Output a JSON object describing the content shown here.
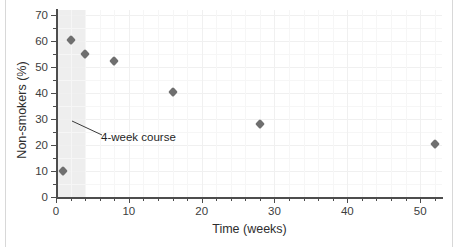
{
  "figure": {
    "background": "#ffffff",
    "frame_color": "#d8d8d8"
  },
  "chart_data": {
    "type": "scatter",
    "title": "",
    "xlabel": "Time (weeks)",
    "ylabel": "Non-smokers (%)",
    "xlim": [
      0,
      53
    ],
    "ylim": [
      0,
      72
    ],
    "xticks": [
      0,
      10,
      20,
      30,
      40,
      50
    ],
    "xtick_labels": [
      "0",
      "10",
      "20",
      "30",
      "40",
      "50"
    ],
    "xticks_minor": [
      2,
      4,
      6,
      8,
      12,
      14,
      16,
      18,
      22,
      24,
      26,
      28,
      32,
      34,
      36,
      38,
      42,
      44,
      46,
      48,
      52
    ],
    "yticks": [
      0,
      10,
      20,
      30,
      40,
      50,
      60,
      70
    ],
    "ytick_labels": [
      "0",
      "10",
      "20",
      "30",
      "40",
      "50",
      "60",
      "70"
    ],
    "yticks_minor": [
      5,
      15,
      25,
      35,
      45,
      55,
      65
    ],
    "grid": true,
    "legend": null,
    "marker_color": "#6f6f6f",
    "marker_shape": "diamond",
    "x": [
      1,
      2,
      4,
      8,
      16,
      28,
      52
    ],
    "y": [
      10,
      60.5,
      55,
      52.5,
      40.5,
      28,
      20.5
    ],
    "points": [
      {
        "x": 1,
        "y": 10
      },
      {
        "x": 2,
        "y": 60.5
      },
      {
        "x": 4,
        "y": 55
      },
      {
        "x": 8,
        "y": 52.5
      },
      {
        "x": 16,
        "y": 40.5
      },
      {
        "x": 28,
        "y": 28
      },
      {
        "x": 52,
        "y": 20.5
      }
    ],
    "shaded_region": {
      "label": "4-week course",
      "x_start": 0,
      "x_end": 4,
      "color": "#ebebeb"
    },
    "annotations": [
      {
        "text": "4-week course",
        "target_x": 2,
        "target_y": 29,
        "label_x": 6,
        "label_y": 24
      }
    ]
  }
}
